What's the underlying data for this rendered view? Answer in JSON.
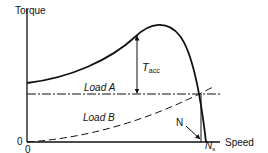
{
  "diagram": {
    "type": "motor torque-speed characteristic",
    "y_axis": {
      "label": "Torque",
      "origin_label": "0"
    },
    "x_axis": {
      "label": "Speed",
      "origin_label": "0",
      "sync_label_main": "N",
      "sync_label_sub": "s"
    },
    "annotations": {
      "accel_torque_main": "T",
      "accel_torque_sub": "acc",
      "load_a": "Load A",
      "load_b": "Load B",
      "operating_point": "N"
    },
    "colors": {
      "line": "#111111",
      "background": "#ffffff"
    }
  }
}
